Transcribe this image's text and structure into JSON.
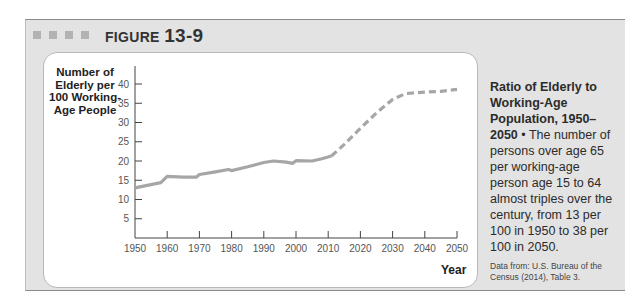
{
  "figure": {
    "label": "FIGURE",
    "number": "13-9"
  },
  "caption": {
    "title": "Ratio of Elderly to Working-Age Population, 1950–2050",
    "bullet": "•",
    "body": "The number of persons over age 65 per working-age person age 15 to 64 almost triples over the century, from 13 per 100 in 1950 to 38 per 100 in 2050.",
    "source": "Data from: U.S. Bureau of the Census (2014), Table 3."
  },
  "colors": {
    "line": "#a6a6a6",
    "panel": "#e3e3e3",
    "squares": "#b3b3b3"
  },
  "chart_data": {
    "type": "line",
    "title": "Ratio of Elderly to Working-Age Population, 1950–2050",
    "xlabel": "Year",
    "ylabel": "Number of Elderly per 100 Working-Age People",
    "xlim": [
      1950,
      2050
    ],
    "ylim": [
      0,
      40
    ],
    "x_ticks": [
      1950,
      1960,
      1970,
      1980,
      1990,
      2000,
      2010,
      2020,
      2030,
      2040,
      2050
    ],
    "y_ticks": [
      5,
      10,
      15,
      20,
      25,
      30,
      35,
      40
    ],
    "grid": false,
    "legend": null,
    "series": [
      {
        "name": "Actual",
        "style": "solid",
        "x": [
          1950,
          1958,
          1960,
          1965,
          1969,
          1970,
          1975,
          1979,
          1980,
          1985,
          1990,
          1993,
          1997,
          1999,
          2000,
          2005,
          2008,
          2011
        ],
        "values": [
          13.0,
          14.4,
          16.0,
          15.8,
          15.8,
          16.5,
          17.2,
          17.8,
          17.5,
          18.5,
          19.6,
          20.0,
          19.7,
          19.4,
          20.1,
          20.0,
          20.6,
          21.3
        ]
      },
      {
        "name": "Projected",
        "style": "dashed",
        "x": [
          2011,
          2015,
          2020,
          2025,
          2030,
          2034,
          2040,
          2045,
          2050
        ],
        "values": [
          21.3,
          24.3,
          28.5,
          32.5,
          36.0,
          37.5,
          37.9,
          38.1,
          38.6
        ]
      }
    ]
  }
}
